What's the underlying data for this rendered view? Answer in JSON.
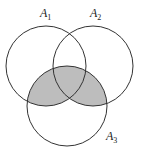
{
  "diagram": {
    "type": "venn",
    "shaded_region": "(A1 ∪ A2) ∩ A3",
    "shade_color": "#bdbdbd",
    "stroke_color": "#333333",
    "sets": [
      {
        "name": "A",
        "sub": "1",
        "cx": 46,
        "cy": 66,
        "r": 40,
        "label_x": 40,
        "label_y": 17
      },
      {
        "name": "A",
        "sub": "2",
        "cx": 93,
        "cy": 66,
        "r": 40,
        "label_x": 90,
        "label_y": 17
      },
      {
        "name": "A",
        "sub": "3",
        "cx": 67,
        "cy": 106,
        "r": 40,
        "label_x": 106,
        "label_y": 140
      }
    ]
  }
}
